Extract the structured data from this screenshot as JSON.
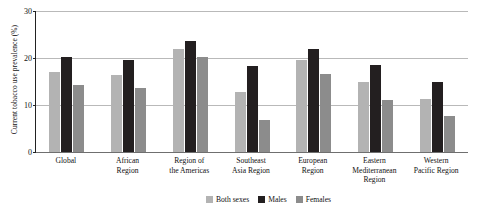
{
  "top_caption": "",
  "chart_data": {
    "type": "bar",
    "title": "",
    "xlabel": "",
    "ylabel": "Current tobacco use prevalence (%)",
    "ylim": [
      0,
      30
    ],
    "yticks": [
      0,
      10,
      20,
      30
    ],
    "ytick_labels": [
      "0",
      "10",
      "20",
      "30"
    ],
    "grid": true,
    "legend_position": "bottom-right",
    "categories": [
      "Global",
      "African Region",
      "Region of the Americas",
      "Southeast Asia Region",
      "European Region",
      "Eastern Mediterranean Region",
      "Western Pacific Region"
    ],
    "category_lines": [
      [
        "Global"
      ],
      [
        "African",
        "Region"
      ],
      [
        "Region of",
        "the Americas"
      ],
      [
        "Southeast",
        "Asia Region"
      ],
      [
        "European",
        "Region"
      ],
      [
        "Eastern",
        "Mediterranean",
        "Region"
      ],
      [
        "Western",
        "Pacific Region"
      ]
    ],
    "series": [
      {
        "name": "Both sexes",
        "color": "#b3b3b3",
        "values": [
          17.0,
          16.3,
          22.0,
          12.7,
          19.6,
          14.9,
          11.3
        ]
      },
      {
        "name": "Males",
        "color": "#231f20",
        "values": [
          20.2,
          19.5,
          23.6,
          18.2,
          21.9,
          18.6,
          14.9
        ]
      },
      {
        "name": "Females",
        "color": "#8c8c8c",
        "values": [
          14.2,
          13.7,
          20.3,
          6.9,
          16.7,
          11.0,
          7.6
        ]
      }
    ]
  }
}
